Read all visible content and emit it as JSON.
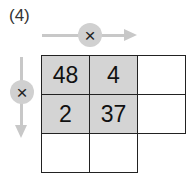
{
  "problem_label": "(4)",
  "operators": {
    "horizontal": {
      "symbol": "×",
      "icon": "arrow-right-icon"
    },
    "vertical": {
      "symbol": "×",
      "icon": "arrow-down-icon"
    }
  },
  "grid": {
    "rows": [
      [
        {
          "value": "48",
          "shaded": true
        },
        {
          "value": "4",
          "shaded": true
        },
        {
          "value": "",
          "shaded": false
        }
      ],
      [
        {
          "value": "2",
          "shaded": true
        },
        {
          "value": "37",
          "shaded": true
        },
        {
          "value": "",
          "shaded": false
        }
      ],
      [
        {
          "value": "",
          "shaded": false
        },
        {
          "value": "",
          "shaded": false
        }
      ]
    ]
  },
  "colors": {
    "shade": "#d4d4d4",
    "arrow": "#c8c8c8",
    "border": "#222222"
  }
}
